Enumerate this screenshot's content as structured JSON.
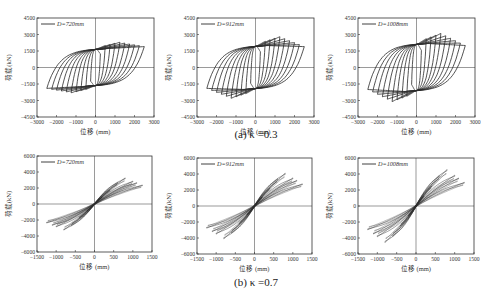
{
  "figure": {
    "captions": [
      "(a) κ =0.3",
      "(b) κ =0.7"
    ],
    "ylabel": "荷载(kN)",
    "xlabel": "位移 (mm)"
  },
  "colors": {
    "curve": "#2a2a2a",
    "axis": "#333333",
    "zero_line": "#555555",
    "background": "#ffffff"
  },
  "chart_data": [
    {
      "type": "line",
      "panel": "a1",
      "title": "",
      "legend": [
        "D=720mm"
      ],
      "xlabel": "位移 (mm)",
      "ylabel": "荷载(kN)",
      "xlim": [
        -3000,
        3000
      ],
      "ylim": [
        -4500,
        4500
      ],
      "xticks": [
        -3000,
        -2000,
        -1000,
        0,
        1000,
        2000,
        3000
      ],
      "yticks": [
        -4500,
        -3000,
        -1500,
        0,
        1500,
        3000,
        4500
      ],
      "loops": {
        "amplitudes_mm": [
          250,
          500,
          750,
          1000,
          1250,
          1500,
          1750,
          2000,
          2250,
          2500
        ],
        "peak_load_kN": 2300,
        "yield_load_kN": 1800,
        "ultimate_disp_mm": 2500,
        "ultimate_load_kN": 1900,
        "character": "spindle-full"
      },
      "frame": {
        "left": 37,
        "top": 18,
        "right": 154,
        "bottom": 117
      }
    },
    {
      "type": "line",
      "panel": "a2",
      "title": "",
      "legend": [
        "D=912mm"
      ],
      "xlabel": "位移 (mm)",
      "ylabel": "荷载(kN)",
      "xlim": [
        -3000,
        3000
      ],
      "ylim": [
        -4500,
        4500
      ],
      "xticks": [
        -3000,
        -2000,
        -1000,
        0,
        1000,
        2000,
        3000
      ],
      "yticks": [
        -4500,
        -3000,
        -1500,
        0,
        1500,
        3000,
        4500
      ],
      "loops": {
        "amplitudes_mm": [
          250,
          500,
          750,
          1000,
          1250,
          1500,
          1750,
          2000,
          2250,
          2500
        ],
        "peak_load_kN": 2800,
        "yield_load_kN": 2100,
        "ultimate_disp_mm": 2500,
        "ultimate_load_kN": 1900,
        "character": "spindle-full"
      },
      "frame": {
        "left": 197,
        "top": 18,
        "right": 314,
        "bottom": 117
      }
    },
    {
      "type": "line",
      "panel": "a3",
      "title": "",
      "legend": [
        "D=1008mm"
      ],
      "xlabel": "位移 (mm)",
      "ylabel": "荷载(kN)",
      "xlim": [
        -3000,
        3000
      ],
      "ylim": [
        -4500,
        4500
      ],
      "xticks": [
        -3000,
        -2000,
        -1000,
        0,
        1000,
        2000,
        3000
      ],
      "yticks": [
        -4500,
        -3000,
        -1500,
        0,
        1500,
        3000,
        4500
      ],
      "loops": {
        "amplitudes_mm": [
          250,
          500,
          750,
          1000,
          1250,
          1500,
          1750,
          2000,
          2250,
          2500
        ],
        "peak_load_kN": 3100,
        "yield_load_kN": 2300,
        "ultimate_disp_mm": 2500,
        "ultimate_load_kN": 2000,
        "character": "spindle-full"
      },
      "frame": {
        "left": 358,
        "top": 18,
        "right": 475,
        "bottom": 117
      }
    },
    {
      "type": "line",
      "panel": "b1",
      "title": "",
      "legend": [
        "D=720mm"
      ],
      "xlabel": "位移 (mm)",
      "ylabel": "荷载(kN)",
      "xlim": [
        -1500,
        1500
      ],
      "ylim": [
        -6000,
        6000
      ],
      "xticks": [
        -1500,
        -1000,
        -500,
        0,
        500,
        1000,
        1500
      ],
      "yticks": [
        -6000,
        -4000,
        -2000,
        0,
        2000,
        4000,
        6000
      ],
      "loops": {
        "amplitudes_mm": [
          200,
          400,
          600,
          800,
          1000,
          1100,
          1250
        ],
        "peak_load_kN": 3400,
        "yield_load_kN": 1500,
        "ultimate_disp_mm": 1250,
        "ultimate_load_kN": 2400,
        "character": "pinched-inclined"
      },
      "frame": {
        "left": 37,
        "top": 156,
        "right": 152,
        "bottom": 252
      }
    },
    {
      "type": "line",
      "panel": "b2",
      "title": "",
      "legend": [
        "D=912mm"
      ],
      "xlabel": "位移 (mm)",
      "ylabel": "荷载(kN)",
      "xlim": [
        -1500,
        1500
      ],
      "ylim": [
        -6000,
        6000
      ],
      "xticks": [
        -1500,
        -1000,
        -500,
        0,
        500,
        1000,
        1500
      ],
      "yticks": [
        -6000,
        -4000,
        -2000,
        0,
        2000,
        4000,
        6000
      ],
      "loops": {
        "amplitudes_mm": [
          200,
          400,
          600,
          800,
          1000,
          1100,
          1250
        ],
        "peak_load_kN": 4300,
        "yield_load_kN": 1800,
        "ultimate_disp_mm": 1250,
        "ultimate_load_kN": 2800,
        "character": "pinched-inclined"
      },
      "frame": {
        "left": 197,
        "top": 158,
        "right": 312,
        "bottom": 254
      }
    },
    {
      "type": "line",
      "panel": "b3",
      "title": "",
      "legend": [
        "D=1008mm"
      ],
      "xlabel": "位移 (mm)",
      "ylabel": "荷载(kN)",
      "xlim": [
        -1500,
        1500
      ],
      "ylim": [
        -6000,
        6000
      ],
      "xticks": [
        -1500,
        -1000,
        -500,
        0,
        500,
        1000,
        1500
      ],
      "yticks": [
        -6000,
        -4000,
        -2000,
        0,
        2000,
        4000,
        6000
      ],
      "loops": {
        "amplitudes_mm": [
          200,
          400,
          600,
          800,
          1000,
          1100,
          1250
        ],
        "peak_load_kN": 4800,
        "yield_load_kN": 2000,
        "ultimate_disp_mm": 1250,
        "ultimate_load_kN": 3000,
        "character": "pinched-inclined"
      },
      "frame": {
        "left": 358,
        "top": 158,
        "right": 474,
        "bottom": 254
      }
    }
  ]
}
